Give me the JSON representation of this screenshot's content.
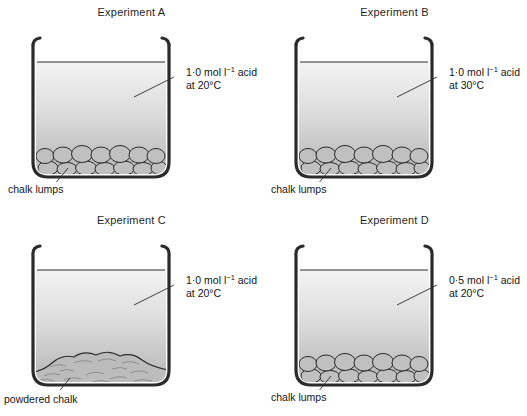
{
  "figure": {
    "background_color": "#ffffff",
    "line_color": "#2b2b2b",
    "liquid_top_color": "#f2f2f2",
    "liquid_bottom_color": "#b6b6b6",
    "solid_fill_color": "#bdbdbd"
  },
  "panels": [
    {
      "title": "Experiment A",
      "acid_line1_pre": "1",
      "acid_line1_dot": "·",
      "acid_line1_mid": "0 mol l",
      "acid_line1_sup": "−1",
      "acid_line1_post": " acid",
      "acid_line2": "at 20°C",
      "solid_label": "chalk lumps",
      "solid_type": "lumps"
    },
    {
      "title": "Experiment B",
      "acid_line1_pre": "1",
      "acid_line1_dot": "·",
      "acid_line1_mid": "0 mol l",
      "acid_line1_sup": "−1",
      "acid_line1_post": " acid",
      "acid_line2": "at 30°C",
      "solid_label": "chalk lumps",
      "solid_type": "lumps"
    },
    {
      "title": "Experiment C",
      "acid_line1_pre": "1",
      "acid_line1_dot": "·",
      "acid_line1_mid": "0 mol l",
      "acid_line1_sup": "−1",
      "acid_line1_post": " acid",
      "acid_line2": "at 20°C",
      "solid_label": "powdered chalk",
      "solid_type": "powder"
    },
    {
      "title": "Experiment D",
      "acid_line1_pre": "0",
      "acid_line1_dot": "·",
      "acid_line1_mid": "5 mol l",
      "acid_line1_sup": "−1",
      "acid_line1_post": " acid",
      "acid_line2": "at 20°C",
      "solid_label": "chalk lumps",
      "solid_type": "lumps"
    }
  ]
}
